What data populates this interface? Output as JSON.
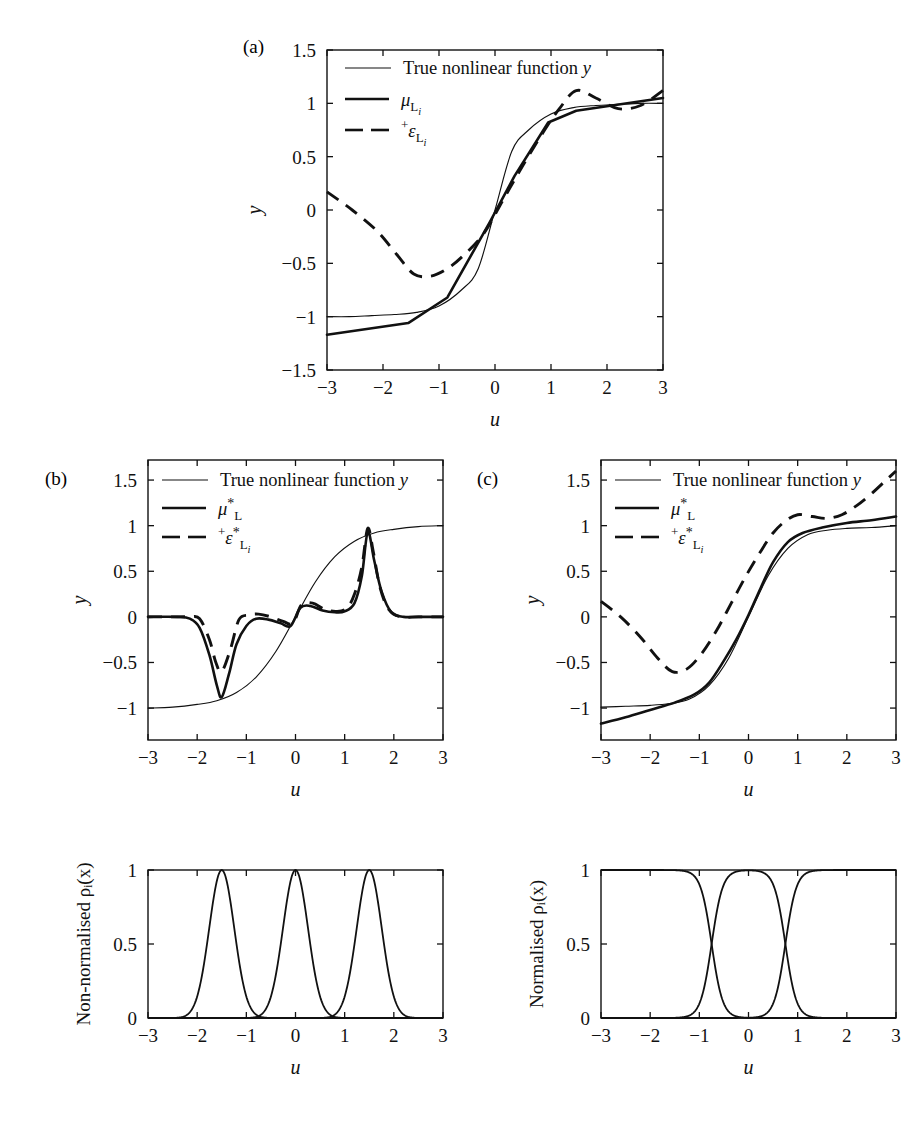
{
  "figure": {
    "panels": [
      {
        "tag": "(a)",
        "tag_x": 243,
        "tag_y": 50
      },
      {
        "tag": "(b)",
        "tag_x": 45,
        "tag_y": 485
      },
      {
        "tag": "(c)",
        "tag_x": 477,
        "tag_y": 485
      }
    ]
  },
  "legend": {
    "true_label": "True nonlinear function",
    "true_symbol": "y",
    "mu_a": {
      "base": "μ",
      "sub": "L",
      "subsub": "i"
    },
    "eps_a": {
      "sup": "+",
      "base": "ε",
      "sub": "L",
      "subsub": "i"
    },
    "mu_bc": {
      "base": "μ",
      "sub": "L",
      "star": "*"
    },
    "eps_bc": {
      "sup": "+",
      "base": "ε",
      "sub": "L",
      "star": "*",
      "subsub": "i"
    }
  },
  "axes": {
    "x_label": "u",
    "y_label": "y",
    "y_label_bottom_left": "Non-normalised ρᵢ(x)",
    "y_label_bottom_right": "Normalised ρᵢ(x)",
    "x_ticks": [
      -3,
      -2,
      -1,
      0,
      1,
      2,
      3
    ],
    "x_tick_labels": [
      "−3",
      "−2",
      "−1",
      "0",
      "1",
      "2",
      "3"
    ],
    "y_ticks_main": [
      -1.5,
      -1,
      -0.5,
      0,
      0.5,
      1,
      1.5
    ],
    "y_tick_labels_main": [
      "−1.5",
      "−1",
      "−0.5",
      "0",
      "0.5",
      "1",
      "1.5"
    ],
    "y_ticks_bc": [
      -1,
      -0.5,
      0,
      0.5,
      1,
      1.5
    ],
    "y_tick_labels_bc": [
      "−1",
      "−0.5",
      "0",
      "0.5",
      "1",
      "1.5"
    ],
    "y_ticks_basis": [
      0,
      0.5,
      1
    ],
    "y_tick_labels_basis": [
      "0",
      "0.5",
      "1"
    ]
  },
  "chart_data": [
    {
      "id": "panel-a",
      "type": "line",
      "title": "(a)",
      "xlabel": "u",
      "ylabel": "y",
      "xlim": [
        -3,
        3
      ],
      "ylim": [
        -1.5,
        1.5
      ],
      "grid": false,
      "legend_position": "top-left",
      "series": [
        {
          "name": "True nonlinear function y",
          "style": "thin-solid",
          "x": [
            -3,
            -2.6,
            -2.2,
            -1.8,
            -1.4,
            -1.0,
            -0.6,
            -0.3,
            0,
            0.3,
            0.6,
            1.0,
            1.4,
            1.8,
            2.2,
            2.6,
            3
          ],
          "y": [
            -1.0,
            -1.0,
            -0.99,
            -0.98,
            -0.96,
            -0.9,
            -0.75,
            -0.55,
            0,
            0.55,
            0.75,
            0.9,
            0.96,
            0.98,
            0.99,
            1.0,
            1.0
          ]
        },
        {
          "name": "mu_Li",
          "style": "thick-solid",
          "x": [
            -3,
            -1.55,
            -0.85,
            -0.1,
            0.35,
            0.95,
            1.45,
            3
          ],
          "y": [
            -1.17,
            -1.06,
            -0.82,
            -0.12,
            0.32,
            0.82,
            0.93,
            1.05
          ]
        },
        {
          "name": "+eps_Li",
          "style": "dashed",
          "x": [
            -3,
            -2.55,
            -2.1,
            -1.75,
            -1.45,
            -1.15,
            -0.85,
            -0.55,
            -0.2,
            0.15,
            0.5,
            0.85,
            1.15,
            1.45,
            1.8,
            2.2,
            2.6,
            3
          ],
          "y": [
            0.17,
            0.0,
            -0.2,
            -0.42,
            -0.6,
            -0.62,
            -0.55,
            -0.42,
            -0.22,
            0.1,
            0.42,
            0.72,
            0.95,
            1.12,
            1.05,
            0.95,
            0.98,
            1.12
          ]
        }
      ]
    },
    {
      "id": "panel-b",
      "type": "line",
      "title": "(b)",
      "xlabel": "u",
      "ylabel": "y",
      "xlim": [
        -3,
        3
      ],
      "ylim": [
        -1.35,
        1.72
      ],
      "grid": false,
      "legend_position": "top-left",
      "series": [
        {
          "name": "True nonlinear function y",
          "style": "thin-solid",
          "x": [
            -3,
            -2.5,
            -2.0,
            -1.6,
            -1.2,
            -0.8,
            -0.4,
            0,
            0.4,
            0.8,
            1.2,
            1.6,
            2.0,
            2.5,
            3
          ],
          "y": [
            -1.0,
            -0.99,
            -0.96,
            -0.92,
            -0.83,
            -0.66,
            -0.38,
            0,
            0.38,
            0.66,
            0.83,
            0.92,
            0.96,
            0.99,
            1.0
          ]
        },
        {
          "name": "mu*_L",
          "style": "thick-solid",
          "x": [
            -3,
            -2.4,
            -2.15,
            -1.95,
            -1.75,
            -1.6,
            -1.5,
            -1.35,
            -1.2,
            -1.0,
            -0.8,
            -0.55,
            -0.3,
            -0.1,
            0.1,
            0.3,
            0.55,
            0.8,
            1.0,
            1.2,
            1.35,
            1.47,
            1.6,
            1.75,
            1.95,
            2.2,
            2.5,
            3
          ],
          "y": [
            0.0,
            0.0,
            -0.02,
            -0.12,
            -0.42,
            -0.75,
            -0.88,
            -0.62,
            -0.3,
            -0.1,
            -0.02,
            -0.03,
            -0.07,
            -0.1,
            0.1,
            0.12,
            0.07,
            0.05,
            0.06,
            0.15,
            0.45,
            0.93,
            0.62,
            0.28,
            0.05,
            0.0,
            0.0,
            0.0
          ]
        },
        {
          "name": "+eps*_Li",
          "style": "dashed",
          "x": [
            -3,
            -2.4,
            -2.15,
            -1.95,
            -1.75,
            -1.62,
            -1.5,
            -1.32,
            -1.15,
            -0.95,
            -0.75,
            -0.5,
            -0.25,
            -0.05,
            0.12,
            0.35,
            0.6,
            0.85,
            1.05,
            1.2,
            1.35,
            1.47,
            1.58,
            1.72,
            1.9,
            2.15,
            2.5,
            3
          ],
          "y": [
            0.0,
            0.0,
            0.0,
            -0.02,
            -0.25,
            -0.5,
            -0.6,
            -0.35,
            -0.03,
            0.02,
            0.03,
            0.0,
            -0.05,
            -0.07,
            0.13,
            0.15,
            0.08,
            0.06,
            0.1,
            0.25,
            0.55,
            0.97,
            0.72,
            0.32,
            0.08,
            0.0,
            0.0,
            0.0
          ]
        }
      ]
    },
    {
      "id": "panel-c",
      "type": "line",
      "title": "(c)",
      "xlabel": "u",
      "ylabel": "y",
      "xlim": [
        -3,
        3
      ],
      "ylim": [
        -1.35,
        1.72
      ],
      "grid": false,
      "legend_position": "top-left",
      "series": [
        {
          "name": "True nonlinear function y",
          "style": "thin-solid",
          "x": [
            -3,
            -2.5,
            -2.0,
            -1.6,
            -1.2,
            -0.8,
            -0.4,
            0,
            0.4,
            0.8,
            1.2,
            1.6,
            2.0,
            2.5,
            3
          ],
          "y": [
            -0.99,
            -0.98,
            -0.97,
            -0.95,
            -0.9,
            -0.75,
            -0.45,
            0,
            0.45,
            0.75,
            0.9,
            0.95,
            0.97,
            0.98,
            1.0
          ]
        },
        {
          "name": "mu*_L",
          "style": "thick-solid",
          "x": [
            -3,
            -2.5,
            -2.0,
            -1.5,
            -1.1,
            -0.8,
            -0.5,
            -0.25,
            0,
            0.25,
            0.5,
            0.8,
            1.1,
            1.5,
            2.0,
            2.5,
            3
          ],
          "y": [
            -1.17,
            -1.1,
            -1.02,
            -0.94,
            -0.85,
            -0.72,
            -0.48,
            -0.25,
            0.02,
            0.32,
            0.6,
            0.82,
            0.92,
            0.98,
            1.03,
            1.06,
            1.1
          ]
        },
        {
          "name": "+eps*_Li",
          "style": "dashed",
          "x": [
            -3,
            -2.6,
            -2.2,
            -1.85,
            -1.55,
            -1.25,
            -0.95,
            -0.65,
            -0.35,
            -0.05,
            0.25,
            0.5,
            0.75,
            1.0,
            1.3,
            1.6,
            1.9,
            2.2,
            2.5,
            2.8,
            3
          ],
          "y": [
            0.17,
            0.0,
            -0.22,
            -0.45,
            -0.6,
            -0.57,
            -0.4,
            -0.15,
            0.15,
            0.45,
            0.72,
            0.92,
            1.05,
            1.12,
            1.1,
            1.08,
            1.12,
            1.22,
            1.35,
            1.5,
            1.6
          ]
        }
      ]
    },
    {
      "id": "panel-basis-nonnormalised",
      "type": "line",
      "title": "Non-normalised basis functions",
      "xlabel": "u",
      "ylabel": "Non-normalised ρᵢ(x)",
      "xlim": [
        -3,
        3
      ],
      "ylim": [
        0,
        1
      ],
      "grid": false,
      "kind": "gaussian",
      "centres": [
        -1.5,
        0,
        1.5
      ],
      "width": 0.36,
      "peak": 1.0
    },
    {
      "id": "panel-basis-normalised",
      "type": "line",
      "title": "Normalised basis functions",
      "xlabel": "u",
      "ylabel": "Normalised ρᵢ(x)",
      "xlim": [
        -3,
        3
      ],
      "ylim": [
        0,
        1
      ],
      "grid": false,
      "kind": "normalised-gaussian",
      "centres": [
        -1.5,
        0,
        1.5
      ],
      "width": 0.58,
      "crossings": [
        -0.72,
        0.85
      ],
      "peak_middle": 0.95
    }
  ]
}
